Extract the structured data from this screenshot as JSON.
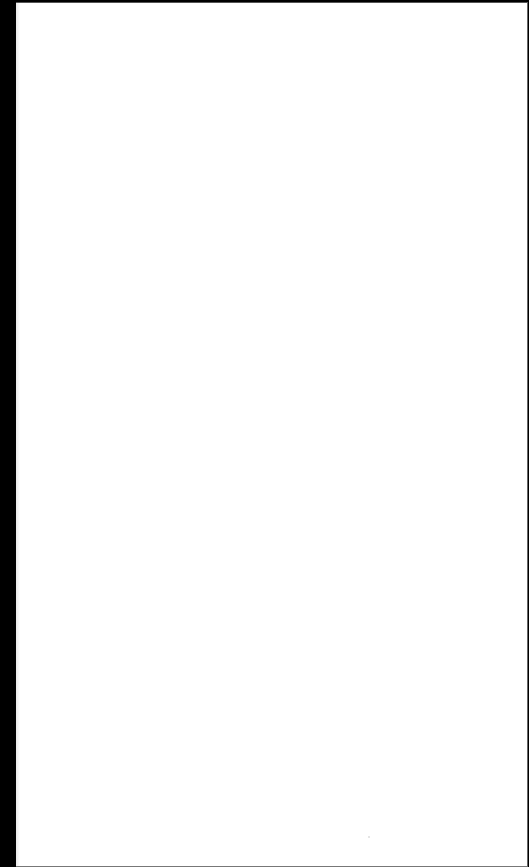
{
  "document": {
    "type": "blank-scanned-page",
    "background_color": "#ffffff",
    "scan_edge_color": "#000000",
    "text_content": []
  }
}
